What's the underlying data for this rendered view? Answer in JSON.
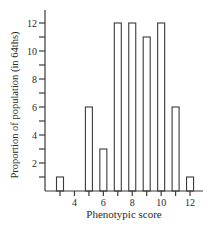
{
  "chart_data": {
    "type": "bar",
    "title": "",
    "xlabel": "Phenotypic score",
    "ylabel": "Proportion of population (in 64ths)",
    "categories": [
      3,
      4,
      5,
      6,
      7,
      8,
      9,
      10,
      11,
      12
    ],
    "values": [
      1,
      0,
      6,
      3,
      12,
      12,
      11,
      12,
      6,
      1
    ],
    "xlim": [
      2,
      13
    ],
    "ylim": [
      0,
      13
    ],
    "x_ticks": [
      3,
      4,
      5,
      6,
      7,
      8,
      9,
      10,
      11,
      12
    ],
    "x_tick_labels": [
      "4",
      "6",
      "8",
      "10",
      "12"
    ],
    "y_ticks": [
      1,
      2,
      3,
      4,
      5,
      6,
      7,
      8,
      9,
      10,
      11,
      12
    ],
    "y_tick_labels": [
      "2",
      "4",
      "6",
      "8",
      "10",
      "12"
    ],
    "grid": false,
    "legend": null,
    "colors": {
      "bar_fill": "#ffffff",
      "bar_stroke": "#3a3a3a",
      "axis": "#3a3a3a"
    }
  }
}
